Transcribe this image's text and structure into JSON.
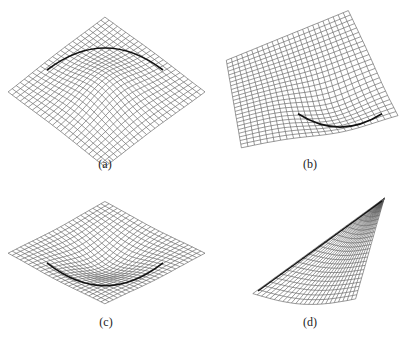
{
  "figure": {
    "background": "#ffffff",
    "line_color": "#555555",
    "grid_n": 24,
    "panels": [
      {
        "id": "a",
        "caption": "(a)",
        "caption_pos": [
          105,
          158
        ],
        "shape": "dome-up",
        "quad": [
          [
            105,
            24
          ],
          [
            196,
            92
          ],
          [
            105,
            160
          ],
          [
            17,
            92
          ]
        ],
        "bulge": 10,
        "fold": "arc-top",
        "fold_center": [
          105,
          48
        ],
        "fold_rx": 58,
        "fold_ry": 22
      },
      {
        "id": "b",
        "caption": "(b)",
        "caption_pos": [
          310,
          158
        ],
        "shape": "saddle-tilted",
        "quad": [
          [
            345,
            16
          ],
          [
            391,
            112
          ],
          [
            246,
            143
          ],
          [
            232,
            62
          ]
        ],
        "bulge": 8,
        "fold": "arc-bottom",
        "fold_center": [
          340,
          118
        ],
        "fold_rx": 42,
        "fold_ry": 14
      },
      {
        "id": "c",
        "caption": "(c)",
        "caption_pos": [
          106,
          316
        ],
        "shape": "dome-down",
        "quad": [
          [
            105,
            206
          ],
          [
            196,
            253
          ],
          [
            105,
            299
          ],
          [
            17,
            253
          ]
        ],
        "bulge": 10,
        "fold": "arc-bottom",
        "fold_center": [
          105,
          270
        ],
        "fold_rx": 58,
        "fold_ry": 24
      },
      {
        "id": "d",
        "caption": "(d)",
        "caption_pos": [
          310,
          316
        ],
        "shape": "triangle-sheet",
        "quad": [
          [
            382,
            201
          ],
          [
            382,
            201
          ],
          [
            355,
            296
          ],
          [
            258,
            291
          ]
        ],
        "bulge": 6,
        "fold": "edge",
        "fold_center": [
          320,
          246
        ],
        "fold_rx": 0,
        "fold_ry": 0
      }
    ]
  }
}
